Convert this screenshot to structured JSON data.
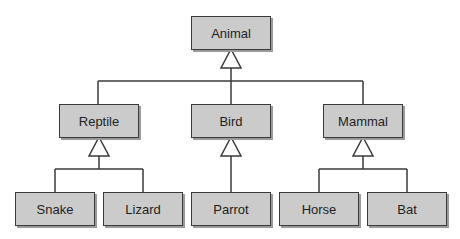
{
  "diagram": {
    "type": "uml-class-hierarchy",
    "relationship": "generalization",
    "colors": {
      "box_fill": "#cbcbcb",
      "box_border": "#3a3a3a",
      "line": "#3a3a3a",
      "shadow": "#9a9a9a"
    },
    "nodes": {
      "animal": {
        "label": "Animal",
        "x": 191,
        "y": 16
      },
      "reptile": {
        "label": "Reptile",
        "x": 59,
        "y": 104,
        "parent": "animal"
      },
      "bird": {
        "label": "Bird",
        "x": 191,
        "y": 104,
        "parent": "animal"
      },
      "mammal": {
        "label": "Mammal",
        "x": 323,
        "y": 104,
        "parent": "animal"
      },
      "snake": {
        "label": "Snake",
        "x": 15,
        "y": 192,
        "parent": "reptile"
      },
      "lizard": {
        "label": "Lizard",
        "x": 103,
        "y": 192,
        "parent": "reptile"
      },
      "parrot": {
        "label": "Parrot",
        "x": 191,
        "y": 192,
        "parent": "bird"
      },
      "horse": {
        "label": "Horse",
        "x": 279,
        "y": 192,
        "parent": "mammal"
      },
      "bat": {
        "label": "Bat",
        "x": 367,
        "y": 192,
        "parent": "mammal"
      }
    }
  }
}
